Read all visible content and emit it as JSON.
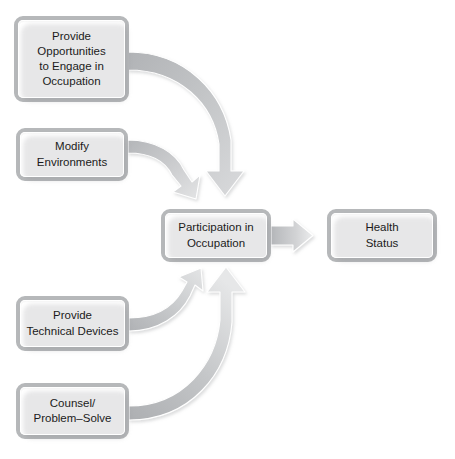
{
  "diagram": {
    "background_color": "#ffffff",
    "node_border_color": "#b6b8ba",
    "node_fill_color": "#ffffff",
    "arrow_fill_color": "#bdbfc1",
    "text_color": "#1b1b1b",
    "nodes": {
      "provide_opportunities": {
        "label": "Provide Opportunities to Engage in Occupation",
        "lines": [
          "Provide",
          "Opportunities",
          "to Engage in",
          "Occupation"
        ]
      },
      "modify_environments": {
        "label": "Modify Environments",
        "lines": [
          "Modify",
          "Environments"
        ]
      },
      "provide_technical_devices": {
        "label": "Provide Technical Devices",
        "lines": [
          "Provide",
          "Technical Devices"
        ]
      },
      "counsel_problem_solve": {
        "label": "Counsel/ Problem–Solve",
        "lines": [
          "Counsel/",
          "Problem–Solve"
        ]
      },
      "participation": {
        "label": "Participation in Occupation",
        "lines": [
          "Participation in",
          "Occupation"
        ]
      },
      "health_status": {
        "label": "Health Status",
        "lines": [
          "Health",
          "Status"
        ]
      }
    },
    "edges": [
      {
        "name": "opportunities-to-participation",
        "from": "provide_opportunities",
        "to": "participation",
        "style": "curved-arrow",
        "direction": "down"
      },
      {
        "name": "modify-to-participation",
        "from": "modify_environments",
        "to": "participation",
        "style": "curved-arrow",
        "direction": "down-right"
      },
      {
        "name": "devices-to-participation",
        "from": "provide_technical_devices",
        "to": "participation",
        "style": "curved-arrow",
        "direction": "up-right"
      },
      {
        "name": "counsel-to-participation",
        "from": "counsel_problem_solve",
        "to": "participation",
        "style": "curved-arrow",
        "direction": "up"
      },
      {
        "name": "participation-to-health",
        "from": "participation",
        "to": "health_status",
        "style": "straight-arrow",
        "direction": "right"
      }
    ]
  }
}
